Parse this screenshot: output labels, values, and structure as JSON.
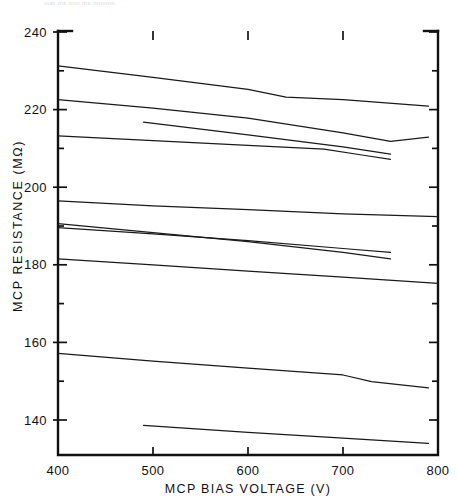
{
  "figure": {
    "header_faint_text": "mat ms  mm  ms  mmmm",
    "background": "#ffffff",
    "line_color": "#1a1a1a",
    "axis_color": "#111111"
  },
  "chart_data": {
    "type": "line",
    "title": "",
    "subtitle": "",
    "xlabel": "MCP BIAS VOLTAGE (V)",
    "ylabel": "MCP RESISTANCE (MΩ)",
    "xlim": [
      400,
      800
    ],
    "ylim": [
      130,
      240
    ],
    "xticks": [
      400,
      500,
      600,
      700,
      800
    ],
    "xtick_labels": [
      "400",
      "500",
      "600",
      "700",
      "800"
    ],
    "yticks": [
      140,
      160,
      180,
      200,
      220,
      240
    ],
    "ytick_labels": [
      "140",
      "160",
      "180",
      "200",
      "220",
      "240"
    ],
    "minor_yticks": [
      150,
      170,
      190,
      210,
      230
    ],
    "grid": false,
    "legend": false,
    "legend_position": "none",
    "annotations": [],
    "series": [
      {
        "name": "MCP 1",
        "x": [
          400,
          500,
          600,
          640,
          700,
          790
        ],
        "values": [
          231.3,
          228.3,
          225.2,
          223.2,
          222.6,
          220.9
        ]
      },
      {
        "name": "MCP 2",
        "x": [
          400,
          500,
          600,
          700,
          750,
          790
        ],
        "values": [
          222.6,
          220.4,
          217.8,
          214.0,
          211.8,
          212.9
        ]
      },
      {
        "name": "MCP 3",
        "x": [
          490,
          600,
          700,
          750
        ],
        "values": [
          216.8,
          213.5,
          210.4,
          208.5
        ]
      },
      {
        "name": "MCP 4",
        "x": [
          400,
          500,
          600,
          680,
          720,
          750
        ],
        "values": [
          213.2,
          212.0,
          210.8,
          209.8,
          208.3,
          207.2
        ]
      },
      {
        "name": "MCP 5",
        "x": [
          400,
          500,
          600,
          700,
          800
        ],
        "values": [
          196.5,
          195.2,
          194.2,
          193.1,
          192.4
        ]
      },
      {
        "name": "MCP 6",
        "x": [
          400,
          500,
          600,
          700,
          750
        ],
        "values": [
          190.6,
          188.3,
          186.0,
          183.2,
          181.5
        ]
      },
      {
        "name": "MCP 7",
        "x": [
          400,
          500,
          600,
          700,
          750
        ],
        "values": [
          189.6,
          188.0,
          186.2,
          184.2,
          183.2
        ]
      },
      {
        "name": "MCP 8",
        "x": [
          400,
          500,
          600,
          700,
          800
        ],
        "values": [
          181.5,
          180.0,
          178.4,
          176.8,
          175.2
        ]
      },
      {
        "name": "MCP 9",
        "x": [
          400,
          500,
          600,
          700,
          730,
          790
        ],
        "values": [
          157.2,
          155.2,
          153.4,
          151.6,
          149.9,
          148.3
        ]
      },
      {
        "name": "MCP 10",
        "x": [
          490,
          600,
          700,
          790
        ],
        "values": [
          138.6,
          136.8,
          135.3,
          134.0
        ]
      }
    ]
  }
}
